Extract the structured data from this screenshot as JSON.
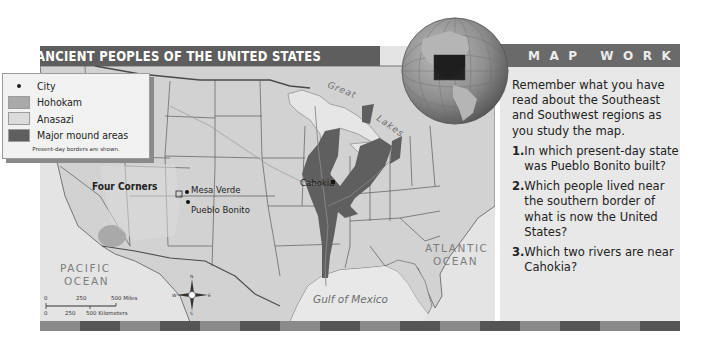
{
  "map": {
    "title": "ANCIENT PEOPLES OF THE UNITED STATES",
    "note": "Present-day borders are shown.",
    "legend": {
      "items": [
        {
          "label": "City",
          "type": "dot",
          "color": "#222222"
        },
        {
          "label": "Hohokam",
          "type": "swatch",
          "color": "#a9a9a9"
        },
        {
          "label": "Anasazi",
          "type": "swatch",
          "color": "#dcdcdc"
        },
        {
          "label": "Major mound areas",
          "type": "swatch",
          "color": "#5f5f5f"
        }
      ]
    },
    "labels": {
      "four_corners": "Four Corners",
      "mesa_verde": "Mesa Verde",
      "pueblo_bonito": "Pueblo Bonito",
      "cahokia": "Cahokia",
      "great_lakes_1": "Great",
      "great_lakes_2": "Lakes",
      "pacific_1": "PACIFIC",
      "pacific_2": "OCEAN",
      "atlantic_1": "ATLANTIC",
      "atlantic_2": "OCEAN",
      "gulf": "Gulf of Mexico"
    },
    "scale": {
      "miles_0": "0",
      "miles_250": "250",
      "miles_500": "500 Miles",
      "km_0": "0",
      "km_250": "250",
      "km_500": "500 Kilometers"
    },
    "compass": {
      "n": "N",
      "s": "S",
      "e": "E",
      "w": "W"
    },
    "colors": {
      "land": "#d4d4d4",
      "water": "#e6e6e6",
      "mound": "#5f5f5f",
      "hohokam": "#a9a9a9",
      "border": "#4a4a4a",
      "title_bar": "#5e5e5e"
    }
  },
  "sidebar": {
    "header": "MAP WORK",
    "intro": "Remember what you have read about the Southeast and Southwest regions as you study the map.",
    "questions": [
      {
        "num": "1.",
        "text": "In which present-day state was Pueblo Bonito built?"
      },
      {
        "num": "2.",
        "text": "Which people lived near the southern border of what is now the United States?"
      },
      {
        "num": "3.",
        "text": "Which two rivers are near Cahokia?"
      }
    ]
  },
  "stripe": {
    "colors": [
      "#8a8a8a",
      "#555555",
      "#8a8a8a",
      "#555555",
      "#8a8a8a",
      "#555555",
      "#8a8a8a",
      "#555555",
      "#8a8a8a",
      "#555555",
      "#8a8a8a",
      "#555555",
      "#8a8a8a",
      "#555555",
      "#8a8a8a",
      "#555555"
    ]
  }
}
